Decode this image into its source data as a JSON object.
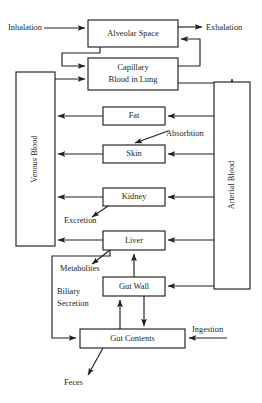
{
  "diagram": {
    "type": "flow-diagram",
    "background_color": "#ffffff",
    "line_color": "#231f20",
    "boxes": [
      {
        "id": "alveolar_space",
        "label": "Alveolar Space",
        "x": 88,
        "y": 20,
        "w": 90,
        "h": 27,
        "orientation": "horizontal"
      },
      {
        "id": "capillary_blood",
        "label": "Capillary\nBlood in Lung",
        "line1": "Capillary",
        "line2": "Blood in Lung",
        "x": 88,
        "y": 58,
        "w": 90,
        "h": 32,
        "orientation": "horizontal"
      },
      {
        "id": "venous_blood",
        "label": "Venous Blood",
        "x": 16,
        "y": 72,
        "w": 39,
        "h": 174,
        "orientation": "vertical"
      },
      {
        "id": "arterial_blood",
        "label": "Arterial Blood",
        "x": 214,
        "y": 82,
        "w": 36,
        "h": 207,
        "orientation": "vertical"
      },
      {
        "id": "fat",
        "label": "Fat",
        "x": 103,
        "y": 107,
        "w": 62,
        "h": 18,
        "orientation": "horizontal"
      },
      {
        "id": "skin",
        "label": "Skin",
        "x": 103,
        "y": 145,
        "w": 62,
        "h": 18,
        "orientation": "horizontal"
      },
      {
        "id": "kidney",
        "label": "Kidney",
        "x": 103,
        "y": 188,
        "w": 62,
        "h": 18,
        "orientation": "horizontal"
      },
      {
        "id": "liver",
        "label": "Liver",
        "x": 103,
        "y": 231,
        "w": 62,
        "h": 19,
        "orientation": "horizontal"
      },
      {
        "id": "gut_wall",
        "label": "Gut Wall",
        "x": 103,
        "y": 277,
        "w": 62,
        "h": 19,
        "orientation": "horizontal"
      },
      {
        "id": "gut_contents",
        "label": "Gut Contents",
        "x": 80,
        "y": 329,
        "w": 105,
        "h": 19,
        "orientation": "horizontal"
      }
    ],
    "labels": [
      {
        "id": "inhalation",
        "text": "Inhalation",
        "x": 8,
        "y": 28,
        "anchor": "start"
      },
      {
        "id": "exhalation",
        "text": "Exhalation",
        "x": 206,
        "y": 28,
        "anchor": "start"
      },
      {
        "id": "absorbtion",
        "text": "Absorbtion",
        "x": 166,
        "y": 134,
        "anchor": "start"
      },
      {
        "id": "excretion",
        "text": "Excretion",
        "x": 64,
        "y": 219,
        "anchor": "start"
      },
      {
        "id": "metabolites",
        "text": "Metabolites",
        "x": 60,
        "y": 268,
        "anchor": "start"
      },
      {
        "id": "biliary",
        "text": "Biliary",
        "x": 57,
        "y": 291,
        "anchor": "start"
      },
      {
        "id": "secretion",
        "text": "Secretion",
        "x": 57,
        "y": 303,
        "anchor": "start"
      },
      {
        "id": "ingestion",
        "text": "Ingestion",
        "x": 192,
        "y": 330,
        "anchor": "start"
      },
      {
        "id": "feces",
        "text": "Feces",
        "x": 64,
        "y": 382,
        "anchor": "start"
      }
    ],
    "flows": [
      {
        "from": "inhalation",
        "to": "alveolar_space",
        "label": "Inhalation"
      },
      {
        "from": "alveolar_space",
        "to": "exhalation",
        "label": "Exhalation"
      },
      {
        "from": "alveolar_space",
        "to": "capillary_blood",
        "label": ""
      },
      {
        "from": "capillary_blood",
        "to": "alveolar_space",
        "label": ""
      },
      {
        "from": "venous_blood",
        "to": "capillary_blood",
        "label": ""
      },
      {
        "from": "capillary_blood",
        "to": "arterial_blood",
        "label": ""
      },
      {
        "from": "arterial_blood",
        "to": "fat",
        "label": ""
      },
      {
        "from": "fat",
        "to": "venous_blood",
        "label": ""
      },
      {
        "from": "arterial_blood",
        "to": "skin",
        "label": ""
      },
      {
        "from": "skin",
        "to": "venous_blood",
        "label": ""
      },
      {
        "from": "absorbtion",
        "to": "skin",
        "label": "Absorbtion"
      },
      {
        "from": "arterial_blood",
        "to": "kidney",
        "label": ""
      },
      {
        "from": "kidney",
        "to": "venous_blood",
        "label": ""
      },
      {
        "from": "kidney",
        "to": "excretion",
        "label": "Excretion"
      },
      {
        "from": "arterial_blood",
        "to": "liver",
        "label": ""
      },
      {
        "from": "liver",
        "to": "venous_blood",
        "label": ""
      },
      {
        "from": "liver",
        "to": "metabolites",
        "label": "Metabolites"
      },
      {
        "from": "arterial_blood",
        "to": "gut_wall",
        "label": ""
      },
      {
        "from": "gut_wall",
        "to": "liver",
        "label": ""
      },
      {
        "from": "gut_wall",
        "to": "gut_contents",
        "label": ""
      },
      {
        "from": "gut_contents",
        "to": "gut_wall",
        "label": ""
      },
      {
        "from": "liver",
        "to": "gut_contents",
        "label": "Biliary Secretion"
      },
      {
        "from": "ingestion",
        "to": "gut_contents",
        "label": "Ingestion"
      },
      {
        "from": "gut_contents",
        "to": "feces",
        "label": "Feces"
      }
    ]
  }
}
